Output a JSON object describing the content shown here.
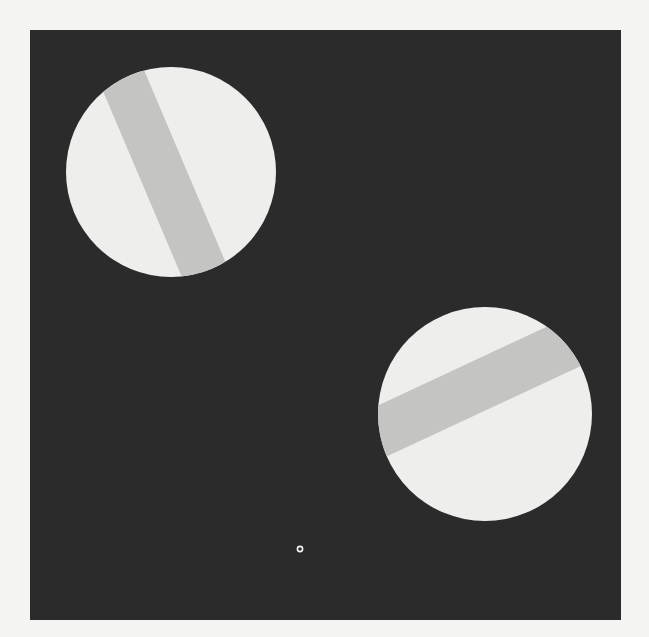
{
  "figure": {
    "background_color": "#f4f4f2",
    "field": {
      "x": 30,
      "y": 30,
      "width": 591,
      "height": 590,
      "color": "#2b2b2b"
    },
    "disks": [
      {
        "name": "upper-left-disk",
        "cx": 171,
        "cy": 172,
        "r": 105,
        "disk_color": "#eeeeec",
        "stripe_color": "#c4c4c2",
        "stripe_angle_deg": -23,
        "stripe_width": 46,
        "stripe_offset": -8
      },
      {
        "name": "lower-right-disk",
        "cx": 485,
        "cy": 414,
        "r": 107,
        "disk_color": "#eeeeec",
        "stripe_color": "#c4c4c2",
        "stripe_angle_deg": 65,
        "stripe_width": 50,
        "stripe_offset": -28
      }
    ],
    "fixation_point": {
      "cx": 300,
      "cy": 549,
      "r": 2.6,
      "color": "#f4f4f4"
    }
  }
}
